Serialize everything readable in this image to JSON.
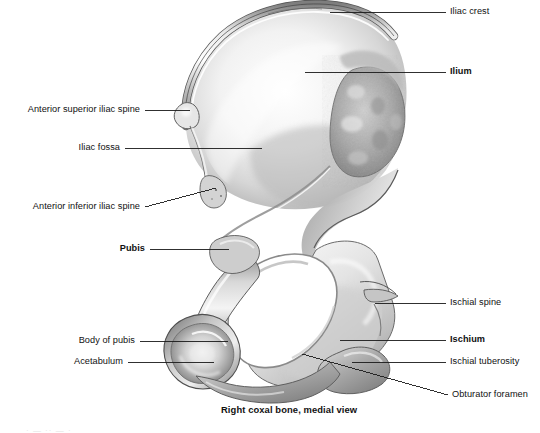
{
  "figure": {
    "caption": "Right coxal bone, medial view",
    "corner_mark": "· — ·· — ·",
    "labels_left": [
      {
        "id": "anterior-superior-iliac-spine",
        "text": "Anterior superior iliac spine",
        "bold": false
      },
      {
        "id": "iliac-fossa",
        "text": "Iliac fossa",
        "bold": false
      },
      {
        "id": "anterior-inferior-iliac-spine",
        "text": "Anterior inferior iliac spine",
        "bold": false
      },
      {
        "id": "pubis",
        "text": "Pubis",
        "bold": true
      },
      {
        "id": "body-of-pubis",
        "text": "Body of pubis",
        "bold": false
      },
      {
        "id": "acetabulum",
        "text": "Acetabulum",
        "bold": false
      }
    ],
    "labels_right": [
      {
        "id": "iliac-crest",
        "text": "Iliac crest",
        "bold": false
      },
      {
        "id": "ilium",
        "text": "Ilium",
        "bold": true
      },
      {
        "id": "ischial-spine",
        "text": "Ischial spine",
        "bold": false
      },
      {
        "id": "ischium",
        "text": "Ischium",
        "bold": true
      },
      {
        "id": "ischial-tuberosity",
        "text": "Ischial tuberosity",
        "bold": false
      },
      {
        "id": "obturator-foramen",
        "text": "Obturator foramen",
        "bold": false
      }
    ],
    "colors": {
      "leader_line": "#1a1a1a",
      "text": "#111111",
      "background": "#ffffff",
      "bone_light": "#fdfdfd",
      "bone_mid": "#c9c9c9",
      "bone_shadow": "#8a8a8a",
      "bone_dark": "#666666"
    }
  }
}
